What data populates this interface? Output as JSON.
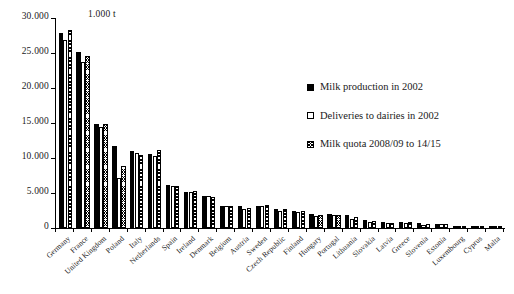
{
  "chart_data": {
    "type": "bar",
    "title": "",
    "subtitle": "",
    "unit_label": "1.000 t",
    "xlabel": "",
    "ylabel": "",
    "ylim": [
      0,
      30000
    ],
    "ytick_values": [
      0,
      5000,
      10000,
      15000,
      20000,
      25000,
      30000
    ],
    "ytick_labels": [
      "0",
      "5.000",
      "10.000",
      "15.000",
      "20.000",
      "25.000",
      "30.000"
    ],
    "grid": false,
    "legend_position": "right-inside",
    "categories": [
      "Germany",
      "France",
      "United Kingdom",
      "Poland",
      "Italy",
      "Netherlands",
      "Spain",
      "Ireland",
      "Denmark",
      "Belgium",
      "Austria",
      "Sweden",
      "Czech Republic",
      "Finland",
      "Hungary",
      "Portugal",
      "Lithuania",
      "Slovakia",
      "Latvia",
      "Greece",
      "Slovenia",
      "Estonia",
      "Luxembourg",
      "Cyprus",
      "Malta"
    ],
    "series": [
      {
        "name": "Milk production in 2002",
        "style": "solid-black",
        "values": [
          27900,
          25100,
          14800,
          11700,
          11000,
          10600,
          6200,
          5200,
          4600,
          3200,
          3200,
          3200,
          2700,
          2400,
          2000,
          2000,
          1800,
          1100,
          800,
          800,
          650,
          620,
          270,
          150,
          40
        ]
      },
      {
        "name": "Deliveries to dairies in 2002",
        "style": "open-white",
        "values": [
          26800,
          23700,
          14500,
          7200,
          10700,
          10300,
          6000,
          5100,
          4600,
          3100,
          2700,
          3200,
          2500,
          2300,
          1700,
          1800,
          1300,
          900,
          650,
          700,
          500,
          570,
          250,
          140,
          35
        ]
      },
      {
        "name": "Milk quota 2008/09 to 14/15",
        "style": "cross-hatch",
        "values": [
          28300,
          24600,
          14800,
          8900,
          10400,
          11100,
          6000,
          5300,
          4500,
          3200,
          2800,
          3300,
          2700,
          2400,
          1900,
          1900,
          1600,
          1000,
          700,
          820,
          560,
          620,
          270,
          150,
          45
        ]
      }
    ]
  },
  "legend": {
    "entries": [
      {
        "label": "Milk production in 2002"
      },
      {
        "label": "Deliveries to dairies in 2002"
      },
      {
        "label": "Milk quota 2008/09 to 14/15"
      }
    ]
  },
  "colors": {
    "series_1": "#000000",
    "series_2": "#ffffff",
    "series_3": "#ffffff",
    "axis": "#000000",
    "background": "#ffffff"
  }
}
